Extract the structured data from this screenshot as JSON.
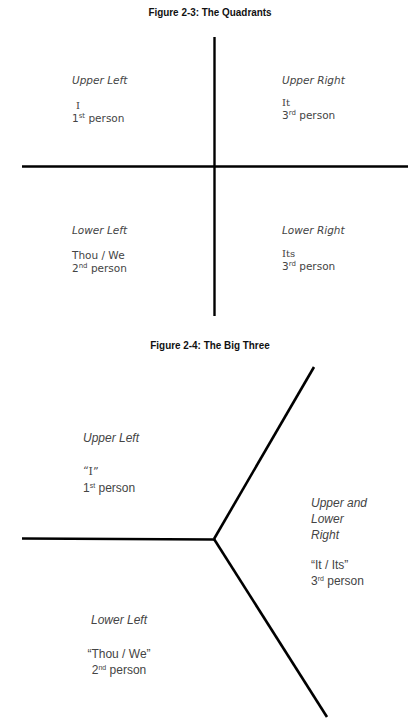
{
  "figure1": {
    "title": "Figure 2-3: The Quadrants",
    "quadrants": [
      {
        "id": "ul",
        "heading": "Upper Left",
        "pronoun": "I",
        "person_num": "1",
        "person_sup": "st",
        "person_word": "person"
      },
      {
        "id": "ur",
        "heading": "Upper Right",
        "pronoun": "It",
        "person_num": "3",
        "person_sup": "rd",
        "person_word": "person"
      },
      {
        "id": "ll",
        "heading": "Lower Left",
        "pronoun": "Thou / We",
        "person_num": "2",
        "person_sup": "nd",
        "person_word": "person"
      },
      {
        "id": "lr",
        "heading": "Lower Right",
        "pronoun": "Its",
        "person_num": "3",
        "person_sup": "rd",
        "person_word": "person"
      }
    ]
  },
  "figure2": {
    "title": "Figure 2-4: The Big Three",
    "regions": [
      {
        "id": "ul",
        "heading": "Upper Left",
        "pronoun": "“I”",
        "person_num": "1",
        "person_sup": "st",
        "person_word": "person"
      },
      {
        "id": "ulr",
        "heading_lines": [
          "Upper and",
          "Lower",
          "Right"
        ],
        "pronoun": "“It / Its”",
        "person_num": "3",
        "person_sup": "rd",
        "person_word": "person"
      },
      {
        "id": "ll",
        "heading": "Lower Left",
        "pronoun": "“Thou / We”",
        "person_num": "2",
        "person_sup": "nd",
        "person_word": "person"
      }
    ]
  },
  "colors": {
    "line": "#000000",
    "text": "#444444",
    "title": "#111111"
  }
}
